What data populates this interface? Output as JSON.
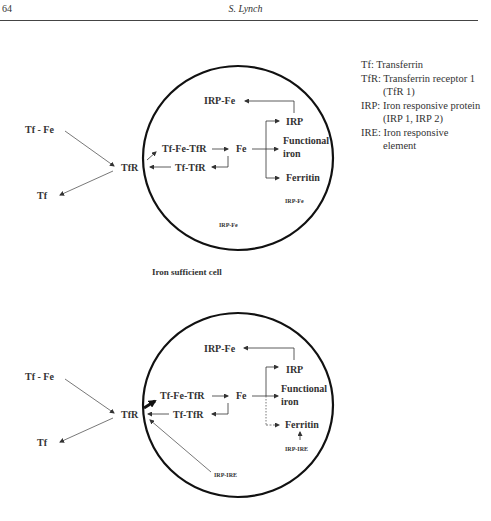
{
  "header": {
    "page_number": "64",
    "running_head": "S. Lynch"
  },
  "legend": {
    "items": [
      {
        "line": "Tf: Transferrin"
      },
      {
        "line": "TfR: Transferrin receptor 1"
      },
      {
        "line": "(TfR 1)",
        "indent": true
      },
      {
        "line": "IRP: Iron responsive protein"
      },
      {
        "line": "(IRP 1, IRP 2)",
        "indent": true
      },
      {
        "line": "IRE: Iron responsive"
      },
      {
        "line": "element",
        "indent": true
      }
    ]
  },
  "diagram_top": {
    "caption": "Iron sufficient cell",
    "outside": {
      "tf_fe": "Tf - Fe",
      "tf": "Tf",
      "tfr": "TfR"
    },
    "inside": {
      "tf_fe_tfr": "Tf-Fe-TfR",
      "tf_tfr": "Tf-TfR",
      "fe": "Fe",
      "irp_fe": "IRP-Fe",
      "irp": "IRP",
      "functional": "Functional",
      "iron": "iron",
      "ferritin": "Ferritin",
      "irp_fe_small_1": "IRP-Fe",
      "irp_fe_small_2": "IRP-Fe"
    }
  },
  "diagram_bottom": {
    "outside": {
      "tf_fe": "Tf - Fe",
      "tf": "Tf",
      "tfr": "TfR"
    },
    "inside": {
      "tf_fe_tfr": "Tf-Fe-TfR",
      "tf_tfr": "Tf-TfR",
      "fe": "Fe",
      "irp_fe": "IRP-Fe",
      "irp": "IRP",
      "functional": "Functional",
      "iron": "iron",
      "ferritin": "Ferritin",
      "irp_ire_1": "IRP-IRE",
      "irp_ire_2": "IRP-IRE"
    }
  }
}
